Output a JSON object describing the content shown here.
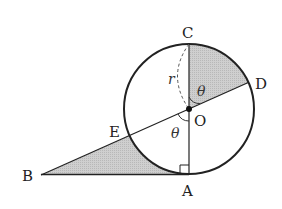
{
  "diagram": {
    "points": {
      "A": "A",
      "B": "B",
      "C": "C",
      "D": "D",
      "E": "E",
      "O": "O"
    },
    "symbols": {
      "radius": "r",
      "angle_top": "θ",
      "angle_bottom": "θ"
    },
    "colors": {
      "stroke": "#222222",
      "shade": "#c8c8c8"
    },
    "relations": [
      "AB tangent to circle at A",
      "OA ⟂ AB (right angle at A)",
      "B, E, O, D collinear",
      "C, O, A collinear (diameter CA)",
      "angle COD = angle EOA = θ"
    ]
  }
}
